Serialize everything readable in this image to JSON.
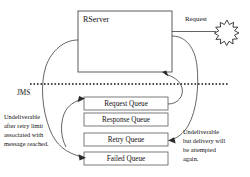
{
  "diagram": {
    "title_node": {
      "label": "RServer"
    },
    "external_request": {
      "label": "Request",
      "endpoint_icon": "burst-icon"
    },
    "boundary": {
      "label": "JMS",
      "style": "dotted-line"
    },
    "queues": [
      {
        "label": "Request Queue",
        "name": "request-queue"
      },
      {
        "label": "Response Queue",
        "name": "response-queue"
      },
      {
        "label": "Retry Queue",
        "name": "retry-queue"
      },
      {
        "label": "Failed Queue",
        "name": "failed-queue"
      }
    ],
    "notes": {
      "left": {
        "lines": [
          "Undeliverable",
          "after retry limit",
          "associated with",
          "message reached."
        ],
        "line1": "Undeliverable",
        "line2": "after retry limit",
        "line3": "associated with",
        "line4": "message reached."
      },
      "right": {
        "lines": [
          "Undeliverable",
          "but delivery will",
          "be attempted",
          "again."
        ],
        "line1": "Undeliverable",
        "line2": "but delivery will",
        "line3": "be attempted",
        "line4": "again."
      }
    },
    "colors": {
      "stroke": "#3d3d3d",
      "text": "#111111",
      "background": "#ffffff"
    }
  }
}
